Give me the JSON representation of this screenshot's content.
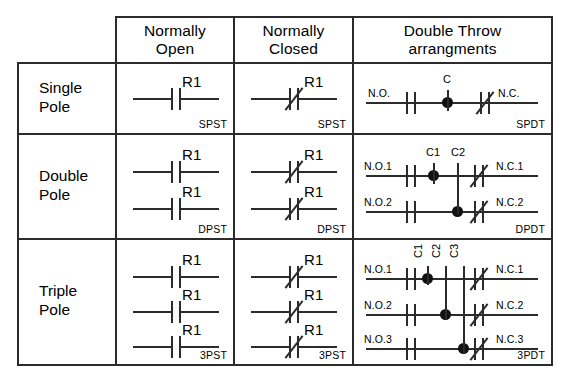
{
  "diagram": {
    "line_color": "#2b2b2b",
    "background": "#ffffff",
    "columns": [
      {
        "id": "normally-open",
        "label_line1": "Normally",
        "label_line2": "Open"
      },
      {
        "id": "normally-closed",
        "label_line1": "Normally",
        "label_line2": "Closed"
      },
      {
        "id": "double-throw",
        "label_line1": "Double Throw",
        "label_line2": "arrangments"
      }
    ],
    "rows": [
      {
        "id": "single-pole",
        "label_line1": "Single",
        "label_line2": "Pole",
        "poles": 1
      },
      {
        "id": "double-pole",
        "label_line1": "Double",
        "label_line2": "Pole",
        "poles": 2
      },
      {
        "id": "triple-pole",
        "label_line1": "Triple",
        "label_line2": "Pole",
        "poles": 3
      }
    ],
    "cells": {
      "single_pole": {
        "normally_open": {
          "code": "SPST",
          "contacts": [
            {
              "label": "R1",
              "type": "no"
            }
          ]
        },
        "normally_closed": {
          "code": "SPST",
          "contacts": [
            {
              "label": "R1",
              "type": "nc"
            }
          ]
        },
        "double_throw": {
          "code": "SPDT",
          "commons": [
            "C"
          ],
          "poles": [
            {
              "no_terminal": "N.O.",
              "nc_terminal": "N.C.",
              "common": "C"
            }
          ]
        }
      },
      "double_pole": {
        "normally_open": {
          "code": "DPST",
          "contacts": [
            {
              "label": "R1",
              "type": "no"
            },
            {
              "label": "R1",
              "type": "no"
            }
          ]
        },
        "normally_closed": {
          "code": "DPST",
          "contacts": [
            {
              "label": "R1",
              "type": "nc"
            },
            {
              "label": "R1",
              "type": "nc"
            }
          ]
        },
        "double_throw": {
          "code": "DPDT",
          "commons": [
            "C1",
            "C2"
          ],
          "poles": [
            {
              "no_terminal": "N.O.1",
              "nc_terminal": "N.C.1",
              "common": "C1"
            },
            {
              "no_terminal": "N.O.2",
              "nc_terminal": "N.C.2",
              "common": "C2"
            }
          ]
        }
      },
      "triple_pole": {
        "normally_open": {
          "code": "3PST",
          "contacts": [
            {
              "label": "R1",
              "type": "no"
            },
            {
              "label": "R1",
              "type": "no"
            },
            {
              "label": "R1",
              "type": "no"
            }
          ]
        },
        "normally_closed": {
          "code": "3PST",
          "contacts": [
            {
              "label": "R1",
              "type": "nc"
            },
            {
              "label": "R1",
              "type": "nc"
            },
            {
              "label": "R1",
              "type": "nc"
            }
          ]
        },
        "double_throw": {
          "code": "3PDT",
          "commons": [
            "C1",
            "C2",
            "C3"
          ],
          "poles": [
            {
              "no_terminal": "N.O.1",
              "nc_terminal": "N.C.1",
              "common": "C1"
            },
            {
              "no_terminal": "N.O.2",
              "nc_terminal": "N.C.2",
              "common": "C2"
            },
            {
              "no_terminal": "N.O.3",
              "nc_terminal": "N.C.3",
              "common": "C3"
            }
          ]
        }
      }
    }
  }
}
